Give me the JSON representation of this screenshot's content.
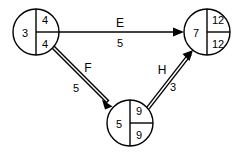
{
  "diagram": {
    "type": "activity-on-arrow-network",
    "background_color": "#ffffff",
    "line_color": "#000000",
    "nodes": [
      {
        "id": "node-left",
        "event_number": "3",
        "earliest_time": "4",
        "latest_time": "4",
        "cx": 36,
        "cy": 32,
        "r": 23
      },
      {
        "id": "node-bottom",
        "event_number": "5",
        "earliest_time": "9",
        "latest_time": "9",
        "cx": 130,
        "cy": 123,
        "r": 23
      },
      {
        "id": "node-right",
        "event_number": "7",
        "earliest_time": "12",
        "latest_time": "12",
        "cx": 207,
        "cy": 32,
        "r": 23
      }
    ],
    "edges": [
      {
        "id": "edge-e",
        "label": "E",
        "weight": "5",
        "style": "single",
        "from": "node-left",
        "to": "node-right",
        "x1": 59,
        "y1": 32,
        "x2": 184,
        "y2": 32,
        "label_x": 120,
        "label_y": 23,
        "weight_x": 120,
        "weight_y": 43
      },
      {
        "id": "edge-f",
        "label": "F",
        "weight": "5",
        "style": "double",
        "from": "node-left",
        "to": "node-bottom",
        "x1": 53,
        "y1": 47,
        "x2": 112,
        "y2": 106,
        "label_x": 88,
        "label_y": 68,
        "weight_x": 76,
        "weight_y": 88
      },
      {
        "id": "edge-h",
        "label": "H",
        "weight": "3",
        "style": "double",
        "from": "node-bottom",
        "to": "node-right",
        "x1": 148,
        "y1": 108,
        "x2": 192,
        "y2": 51,
        "label_x": 162,
        "label_y": 70,
        "weight_x": 173,
        "weight_y": 87
      }
    ]
  }
}
